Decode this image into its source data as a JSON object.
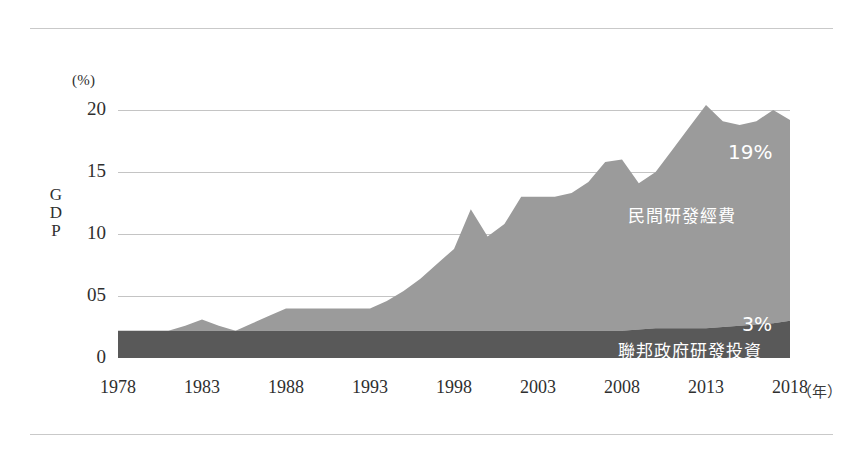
{
  "chart_data": {
    "type": "area",
    "stacked": true,
    "title": "",
    "subtitle": "",
    "xlabel": "年",
    "ylabel": "GDP",
    "yunit": "(%)",
    "grid": true,
    "legend_position": "inside-plot",
    "xlim": [
      1978,
      2018
    ],
    "ylim": [
      0,
      20
    ],
    "ytick_labels": [
      "20",
      "15",
      "10",
      "05",
      "0"
    ],
    "ytick_values": [
      20,
      15,
      10,
      5,
      0
    ],
    "xtick_labels": [
      "1978",
      "1983",
      "1988",
      "1993",
      "1998",
      "2003",
      "2008",
      "2013",
      "2018"
    ],
    "xtick_values": [
      1978,
      1983,
      1988,
      1993,
      1998,
      2003,
      2008,
      2013,
      2018
    ],
    "x": [
      1978,
      1979,
      1980,
      1981,
      1982,
      1983,
      1984,
      1985,
      1986,
      1987,
      1988,
      1989,
      1990,
      1991,
      1992,
      1993,
      1994,
      1995,
      1996,
      1997,
      1998,
      1999,
      2000,
      2001,
      2002,
      2003,
      2004,
      2005,
      2006,
      2007,
      2008,
      2009,
      2010,
      2011,
      2012,
      2013,
      2014,
      2015,
      2016,
      2017,
      2018
    ],
    "series": [
      {
        "name": "聯邦政府研發投資",
        "color": "#595959",
        "end_label": "3%",
        "values": [
          2.2,
          2.2,
          2.2,
          2.2,
          2.2,
          2.2,
          2.2,
          2.2,
          2.2,
          2.2,
          2.2,
          2.2,
          2.2,
          2.2,
          2.2,
          2.2,
          2.2,
          2.2,
          2.2,
          2.2,
          2.2,
          2.2,
          2.2,
          2.2,
          2.2,
          2.2,
          2.2,
          2.2,
          2.2,
          2.2,
          2.2,
          2.3,
          2.4,
          2.4,
          2.4,
          2.4,
          2.5,
          2.6,
          2.7,
          2.8,
          3.0
        ]
      },
      {
        "name": "民間研發經費",
        "color": "#9b9b9b",
        "end_label": "19%",
        "values": [
          0.0,
          0.0,
          0.0,
          0.0,
          0.4,
          0.9,
          0.4,
          0.0,
          0.6,
          1.2,
          1.8,
          1.8,
          1.8,
          1.8,
          1.8,
          1.8,
          2.4,
          3.2,
          4.2,
          5.4,
          6.6,
          9.8,
          7.6,
          8.6,
          10.8,
          10.8,
          10.8,
          11.1,
          12.0,
          13.6,
          13.8,
          11.8,
          12.6,
          14.4,
          16.2,
          18.0,
          16.6,
          16.2,
          16.4,
          17.2,
          16.2
        ]
      }
    ],
    "totals": [
      2.2,
      2.2,
      2.2,
      2.2,
      2.6,
      3.1,
      2.6,
      2.2,
      2.8,
      3.4,
      4.0,
      4.0,
      4.0,
      4.0,
      4.0,
      4.0,
      4.6,
      5.4,
      6.4,
      7.6,
      8.8,
      12.0,
      9.8,
      10.8,
      13.0,
      13.0,
      13.0,
      13.3,
      14.2,
      15.8,
      16.0,
      14.1,
      15.0,
      16.8,
      18.6,
      20.4,
      19.1,
      18.8,
      19.1,
      20.0,
      19.2
    ]
  }
}
